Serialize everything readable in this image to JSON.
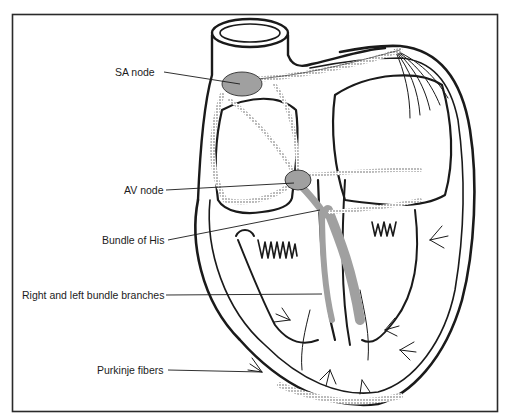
{
  "diagram": {
    "labels": [
      {
        "id": "sa-node",
        "text": "SA node",
        "x": 115,
        "y": 66,
        "target": [
          240,
          83
        ]
      },
      {
        "id": "av-node",
        "text": "AV node",
        "x": 125,
        "y": 184,
        "target": [
          295,
          183
        ]
      },
      {
        "id": "bundle-of-his",
        "text": "Bundle of His",
        "x": 103,
        "y": 234,
        "target": [
          318,
          212
        ]
      },
      {
        "id": "bundle-branches",
        "text": "Right and left bundle branches",
        "x": 23,
        "y": 289,
        "target": [
          322,
          294
        ]
      },
      {
        "id": "purkinje-fibers",
        "text": "Purkinje fibers",
        "x": 98,
        "y": 364,
        "target": [
          262,
          372
        ]
      }
    ],
    "caption": "Figure: conduction system of the heart"
  },
  "colors": {
    "ink": "#1a1a1a",
    "frame": "#2a2a2a",
    "background": "#ffffff",
    "stipple": "#555555"
  }
}
